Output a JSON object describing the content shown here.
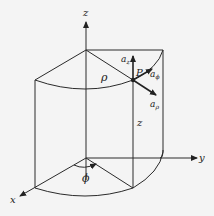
{
  "diagram": {
    "labels": {
      "z_axis": "z",
      "x_axis": "x",
      "y_axis": "y",
      "rho": "ρ",
      "z_height": "z",
      "phi": "ϕ",
      "point": "P",
      "a_z": "a",
      "a_z_sub": "z",
      "a_phi": "a",
      "a_phi_sub": "ϕ",
      "a_rho": "a",
      "a_rho_sub": "ρ"
    },
    "colors": {
      "background": "#f4f4f4",
      "line": "#2a2a2a"
    }
  }
}
